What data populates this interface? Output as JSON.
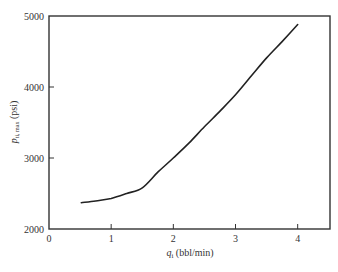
{
  "chart_data": {
    "type": "line",
    "title": "",
    "xlabel": "q_i (bbl/min)",
    "xlabel_main": "q",
    "xlabel_sub": "i",
    "xlabel_unit": " (bbl/min)",
    "ylabel": "p_ti,max (psi)",
    "ylabel_main": "p",
    "ylabel_sub": "ti, max",
    "ylabel_unit": " (psi)",
    "xlim": [
      0,
      4.52
    ],
    "ylim": [
      2000,
      5000
    ],
    "xticks": [
      0,
      1,
      2,
      3,
      4
    ],
    "xtick_labels": [
      "0",
      "1",
      "2",
      "3",
      "4"
    ],
    "yticks": [
      2000,
      3000,
      4000,
      5000
    ],
    "ytick_labels": [
      "2000",
      "3000",
      "4000",
      "5000"
    ],
    "grid": false,
    "legend": null,
    "series": [
      {
        "name": "p_ti,max",
        "color": "#222222",
        "x": [
          0.52,
          0.75,
          1.0,
          1.25,
          1.5,
          1.75,
          2.0,
          2.25,
          2.5,
          2.75,
          3.0,
          3.25,
          3.5,
          3.75,
          4.0
        ],
        "y": [
          2370,
          2395,
          2430,
          2500,
          2580,
          2800,
          3000,
          3210,
          3440,
          3660,
          3890,
          4150,
          4410,
          4640,
          4880
        ]
      }
    ]
  }
}
